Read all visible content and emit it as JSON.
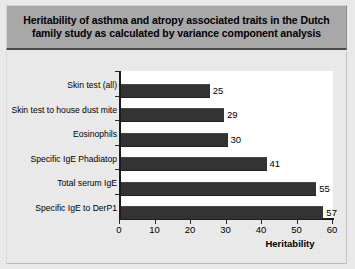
{
  "figure": {
    "title": "Heritability of asthma and atropy associated traits in the Dutch family study as calculated by variance component analysis",
    "banner_color": "#a8a8a8",
    "background_color": "#e9e9e9",
    "bar_color": "#333333",
    "plot_background": "#ffffff"
  },
  "chart_data": {
    "type": "bar",
    "orientation": "horizontal",
    "title": "Heritability of asthma and atropy associated traits in the Dutch family study as calculated by variance component analysis",
    "categories": [
      "Skin test (all)",
      "Skin test to house dust mite",
      "Eosinophils",
      "Specific IgE Phadiatop",
      "Total serum IgE",
      "Specific IgE to DerP1"
    ],
    "values": [
      25,
      29,
      30,
      41,
      55,
      57
    ],
    "data_labels": [
      "25",
      "29",
      "30",
      "41",
      "55",
      "57"
    ],
    "xlabel": "Heritability",
    "ylabel": "",
    "xlim": [
      0,
      60
    ],
    "xticks": [
      0,
      10,
      20,
      30,
      40,
      50,
      60
    ],
    "xtick_labels": [
      "0",
      "10",
      "20",
      "30",
      "40",
      "50",
      "60"
    ],
    "grid": false,
    "legend": null
  }
}
